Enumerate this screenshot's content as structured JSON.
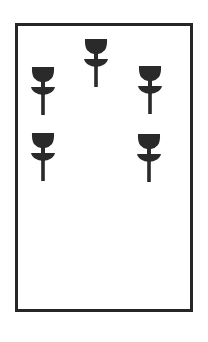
{
  "card": {
    "suit": "cups",
    "rank": 5,
    "border_color": "#262626",
    "pip_color": "#2a2a2a",
    "pips": [
      {
        "icon": "cup-icon",
        "x": 96,
        "y": 38
      },
      {
        "icon": "cup-icon",
        "x": 43,
        "y": 66
      },
      {
        "icon": "cup-icon",
        "x": 150,
        "y": 65
      },
      {
        "icon": "cup-icon",
        "x": 43,
        "y": 132
      },
      {
        "icon": "cup-icon",
        "x": 149,
        "y": 133
      }
    ]
  }
}
